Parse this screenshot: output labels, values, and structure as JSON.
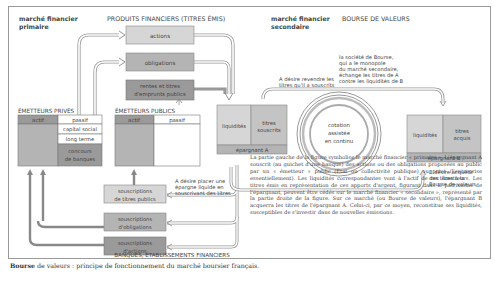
{
  "labels": {
    "primary_market": [
      "marché financier",
      "primaire"
    ],
    "secondary_market": [
      "marché financier",
      "secondaire"
    ],
    "products_title": "PRODUITS FINANCIERS (TITRES ÉMIS)",
    "bourse_title": "BOURSE DE VALEURS",
    "private_issuers": "ÉMETTEURS PRIVÉS",
    "public_issuers": "ÉMETTEURS PUBLICS",
    "banks": "BANQUES, ÉTABLISSEMENTS FINANCIERS"
  },
  "products": [
    "actions",
    "obligations",
    "rentes et titres d'emprunts publics"
  ],
  "private_balance": {
    "actif": "actif",
    "passif": "passif",
    "rows": [
      "capital social",
      "long terme",
      "concours de banques"
    ]
  },
  "public_balance": {
    "actif": "actif",
    "passif": "passif"
  },
  "saver_a": {
    "left": "liquidités",
    "right": "titres souscrits",
    "label": "épargnant A"
  },
  "saver_b": {
    "left": "liquidités",
    "right": "titres acquis",
    "label": "épargnant B"
  },
  "circle": [
    "cotation",
    "assistée",
    "en continu"
  ],
  "subscriptions": [
    "souscriptions de titres publics",
    "souscriptions d'obligations",
    "souscriptions d'actions"
  ],
  "annotations": {
    "a_resell": [
      "A désire revendre les",
      "titres qu'il a souscrits"
    ],
    "societe": [
      "la société de Bourse,",
      "qui a le monopole",
      "du marché secondaire,",
      "échange les titres de A",
      "contre les liquidités de B"
    ],
    "a_place": [
      "A désire placer une",
      "épargne liquide en",
      "souscrivant des titres"
    ],
    "b_acquire": [
      "B désire acquérir",
      "des titres à la",
      "Bourse de valeurs"
    ]
  },
  "explanation": "La partie gauche de la figure symbolise le marché financier « primaire ». L'épargnant A souscrit (au guichet d'une banque) des actions ou des obligations proposées au public par un « émetteur » public (État ou collectivité publique) ou privé (l'entreprise essentiellement). Les liquidités correspondantes vont à l'actif de ces émetteurs. Les titres émis en représentation de ces apports d'argent, figurant dans le patrimoine de l'épargnant, peuvent être cédés sur le marché financier « secondaire », représenté par la partie droite de la figure. Sur ce marché (ou Bourse de valeurs), l'épargnant B acquerra les titres de l'épargnant A. Celui-ci, par ce moyen, reconstitue ses liquidités, susceptibles de s'investir dans de nouvelles émissions.",
  "caption": {
    "bold": "Bourse",
    "rest": " de valeurs : principe de fonctionnement du marché boursier français."
  },
  "colors": {
    "light": "#d6d6d6",
    "mid": "#b4b4b4",
    "dark": "#9a9a9a",
    "arrow": "#8c8c8c"
  }
}
